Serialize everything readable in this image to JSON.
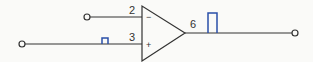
{
  "diagram": {
    "type": "op-amp circuit (comparator / non-inverting buffer)",
    "opamp": {
      "inverting_sign": "−",
      "noninverting_sign": "+",
      "pins": {
        "inverting": "2",
        "noninverting": "3",
        "output": "6"
      }
    },
    "signals": {
      "input_pulse": "small square pulse on pin 3 input",
      "output_pulse": "large square pulse on pin 6 output"
    },
    "colors": {
      "wire": "#333333",
      "pulse": "#2a4fa8"
    }
  }
}
